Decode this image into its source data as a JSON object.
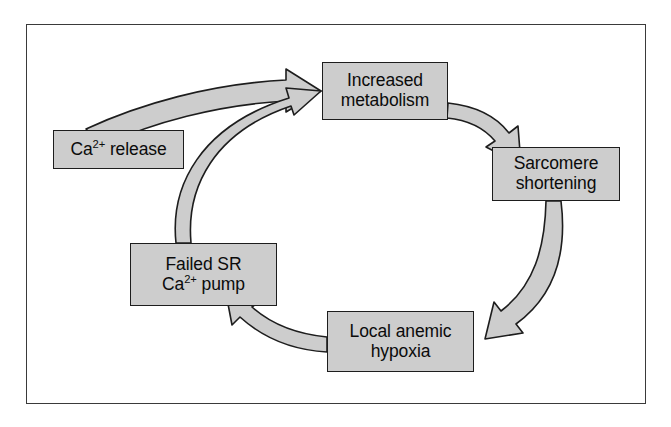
{
  "figure": {
    "type": "cycle-flow-diagram",
    "title": "",
    "border_color": "#3a3a3a",
    "background": "#ffffff"
  },
  "style": {
    "node_fill": "#cdcdcd",
    "node_border": "#1d1d1d",
    "arrow_fill": "#cdcdcd",
    "arrow_stroke": "#1d1d1d",
    "text_color": "#0b0b0b"
  },
  "nodes": [
    {
      "id": "increased-metabolism",
      "lines": [
        "Increased",
        "metabolism"
      ],
      "line1": "Increased",
      "line2": "metabolism"
    },
    {
      "id": "ca-release",
      "lines": [
        "Ca2+ release"
      ],
      "prefix": "Ca",
      "sup": "2+",
      "suffix": " release"
    },
    {
      "id": "sarcomere-shortening",
      "lines": [
        "Sarcomere",
        "shortening"
      ],
      "line1": "Sarcomere",
      "line2": "shortening"
    },
    {
      "id": "failed-sr-pump",
      "lines": [
        "Failed SR",
        "Ca2+ pump"
      ],
      "line1": "Failed SR",
      "prefix": "Ca",
      "sup": "2+",
      "suffix": " pump"
    },
    {
      "id": "local-anemic-hypoxia",
      "lines": [
        "Local anemic",
        "hypoxia"
      ],
      "line1": "Local anemic",
      "line2": "hypoxia"
    }
  ],
  "edges": [
    {
      "id": "edge-ca-release-to-increased-metabolism",
      "from": "ca-release",
      "to": "increased-metabolism",
      "label": ""
    },
    {
      "id": "edge-increased-metabolism-to-sarcomere",
      "from": "increased-metabolism",
      "to": "sarcomere-shortening",
      "label": ""
    },
    {
      "id": "edge-sarcomere-to-local-anemic",
      "from": "sarcomere-shortening",
      "to": "local-anemic-hypoxia",
      "label": ""
    },
    {
      "id": "edge-local-anemic-to-failed-sr-pump",
      "from": "local-anemic-hypoxia",
      "to": "failed-sr-pump",
      "label": ""
    },
    {
      "id": "edge-failed-sr-pump-to-increased-metabolism",
      "from": "failed-sr-pump",
      "to": "increased-metabolism",
      "label": ""
    }
  ]
}
